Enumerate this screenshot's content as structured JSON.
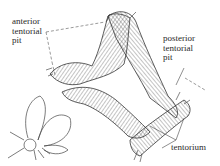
{
  "figure": {
    "labels": {
      "anterior_tentorial_pit": "anterior\ntentorial\npit",
      "posterior_tentorial_pit": "posterior\ntentorial\npit",
      "tentorium": "tentorium"
    },
    "colors": {
      "line": "#3a3a3a",
      "background": "#ffffff"
    }
  }
}
